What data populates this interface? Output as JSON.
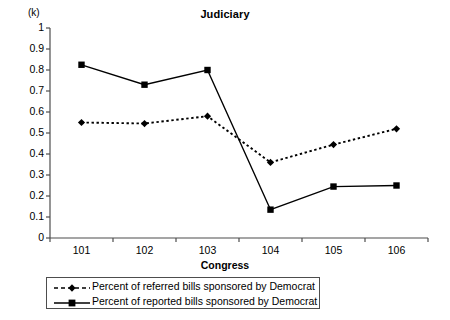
{
  "chart_data": {
    "type": "line",
    "title": "Judiciary",
    "xlabel": "Congress",
    "ylabel": "(k)",
    "categories": [
      "101",
      "102",
      "103",
      "104",
      "105",
      "106"
    ],
    "ylim": [
      0,
      1
    ],
    "ytick_labels": [
      "1",
      "0.9",
      "0.8",
      "0.7",
      "0.6",
      "0.5",
      "0.4",
      "0.3",
      "0.2",
      "0.1",
      "0"
    ],
    "ytick_values": [
      1,
      0.9,
      0.8,
      0.7,
      0.6,
      0.5,
      0.4,
      0.3,
      0.2,
      0.1,
      0
    ],
    "grid": false,
    "legend_position": "bottom",
    "series": [
      {
        "name": "Percent of referred bills sponsored by Democrat",
        "marker": "diamond",
        "line_style": "dotted",
        "color": "#000000",
        "values": [
          0.55,
          0.545,
          0.58,
          0.36,
          0.445,
          0.52
        ]
      },
      {
        "name": "Percent of reported bills sponsored by Democrat",
        "marker": "square",
        "line_style": "solid",
        "color": "#000000",
        "values": [
          0.825,
          0.73,
          0.8,
          0.135,
          0.245,
          0.25
        ]
      }
    ]
  }
}
